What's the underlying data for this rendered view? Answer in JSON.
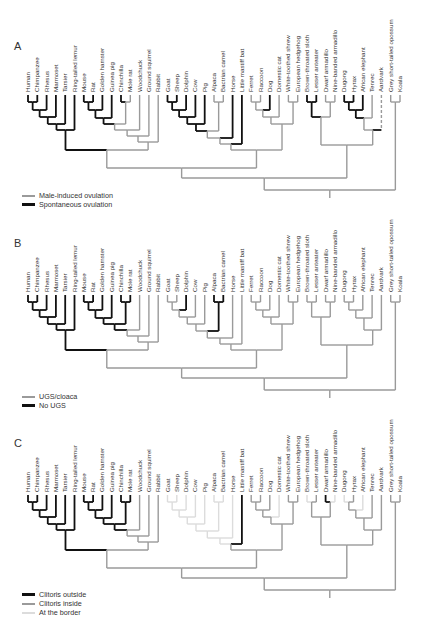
{
  "figure": {
    "taxa": [
      "Human",
      "Chimpanzee",
      "Rhesus",
      "Marmoset",
      "Tarsier",
      "Ring-tailed lemur",
      "Mouse",
      "Rat",
      "Golden hamster",
      "Guinea pig",
      "Chinchilla",
      "Mole rat",
      "Woodchuck",
      "Ground squirrel",
      "Rabbit",
      "Goat",
      "Sheep",
      "Dolphin",
      "Cow",
      "Pig",
      "Alpaca",
      "Bactrian camel",
      "Horse",
      "Little mastiff bat",
      "Ferret",
      "Raccoon",
      "Dog",
      "Domestic cat",
      "White-toothed shrew",
      "European hedgehog",
      "Brown-throated sloth",
      "Lesser anteater",
      "Dwarf armadillo",
      "Nine-banded armadillo",
      "Dugong",
      "Hyrax",
      "African elephant",
      "Tenrec",
      "Aardvark",
      "Grey short-tailed opossum",
      "Koala"
    ],
    "colors": {
      "black": "#111111",
      "gray": "#9a9a9a",
      "light": "#dcdcdc"
    },
    "panels": [
      {
        "letter": "A",
        "top": 0,
        "legend": [
          {
            "label": "Male-induced ovulation",
            "color": "#9a9a9a"
          },
          {
            "label": "Spontaneous ovulation",
            "color": "#111111"
          }
        ],
        "leaf_states": [
          "k",
          "k",
          "k",
          "k",
          "k",
          "k",
          "k",
          "k",
          "k",
          "k",
          "k",
          "g",
          "g",
          "g",
          "g",
          "k",
          "k",
          "k",
          "k",
          "k",
          "g",
          "g",
          "k",
          "k",
          "g",
          "g",
          "k",
          "g",
          "g",
          "g",
          "k",
          "k",
          "g",
          "g",
          "k",
          "k",
          "k",
          "g",
          "d",
          "g",
          "g"
        ]
      },
      {
        "letter": "B",
        "top": 200,
        "legend": [
          {
            "label": "UGS/cloaca",
            "color": "#9a9a9a"
          },
          {
            "label": "No UGS",
            "color": "#111111"
          }
        ],
        "leaf_states": [
          "k",
          "k",
          "k",
          "k",
          "k",
          "k",
          "k",
          "k",
          "k",
          "k",
          "k",
          "k",
          "g",
          "g",
          "g",
          "g",
          "g",
          "k",
          "g",
          "g",
          "k",
          "k",
          "g",
          "g",
          "g",
          "g",
          "g",
          "g",
          "g",
          "g",
          "g",
          "g",
          "g",
          "g",
          "g",
          "g",
          "g",
          "g",
          "g",
          "g",
          "g"
        ]
      },
      {
        "letter": "C",
        "top": 400,
        "legend": [
          {
            "label": "Clitoris outside",
            "color": "#111111"
          },
          {
            "label": "Clitoris inside",
            "color": "#9a9a9a"
          },
          {
            "label": "At the border",
            "color": "#dcdcdc"
          }
        ],
        "leaf_states": [
          "k",
          "k",
          "k",
          "k",
          "k",
          "k",
          "k",
          "k",
          "k",
          "k",
          "k",
          "k",
          "g",
          "g",
          "g",
          "l",
          "l",
          "l",
          "l",
          "l",
          "l",
          "l",
          "l",
          "k",
          "g",
          "g",
          "g",
          "l",
          "g",
          "g",
          "l",
          "g",
          "k",
          "l",
          "l",
          "g",
          "l",
          "g",
          "g",
          "g",
          "g"
        ]
      }
    ]
  }
}
